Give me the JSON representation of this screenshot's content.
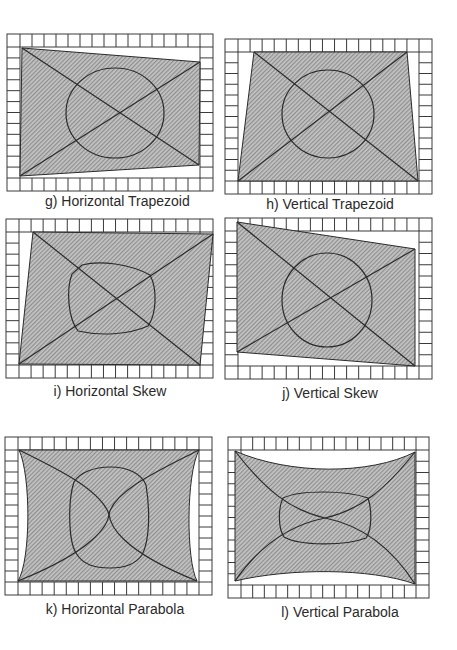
{
  "figure": {
    "panels": [
      {
        "id": "g",
        "caption": "g) Horizontal Trapezoid",
        "frame": [
          7,
          34,
          213,
          191
        ],
        "distortion": "horizontal-trapezoid"
      },
      {
        "id": "h",
        "caption": "h) Vertical Trapezoid",
        "frame": [
          225,
          39,
          432,
          194
        ],
        "distortion": "vertical-trapezoid"
      },
      {
        "id": "i",
        "caption": "i) Horizontal Skew",
        "frame": [
          6,
          219,
          213,
          378
        ],
        "distortion": "horizontal-skew"
      },
      {
        "id": "j",
        "caption": "j) Vertical Skew",
        "frame": [
          225,
          218,
          432,
          379
        ],
        "distortion": "vertical-skew"
      },
      {
        "id": "k",
        "caption": "k) Horizontal Parabola",
        "frame": [
          5,
          437,
          212,
          595
        ],
        "distortion": "horizontal-parabola"
      },
      {
        "id": "l",
        "caption": "l) Vertical Parabola",
        "frame": [
          228,
          437,
          429,
          598
        ],
        "distortion": "vertical-parabola"
      }
    ]
  },
  "colors": {
    "fill": "#b8b8b8",
    "stroke": "#2b2b2b",
    "frame": "#3a3a3a",
    "background": "#ffffff"
  }
}
